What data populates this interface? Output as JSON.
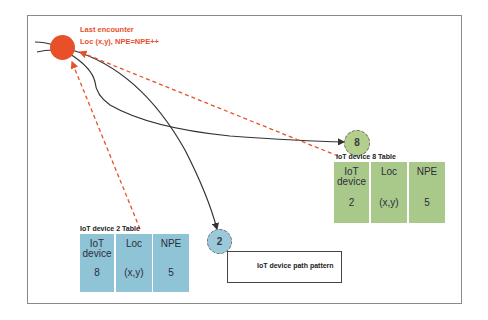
{
  "annotation": {
    "line1": "Last encounter",
    "line2": "Loc (x,y), NPE=NPE++",
    "color": "#e8502a"
  },
  "nodes": [
    {
      "id": "last-encounter",
      "label": "",
      "color": "#e8502a"
    },
    {
      "id": "device-8",
      "label": "8",
      "color": "#b3cf8c"
    },
    {
      "id": "device-2",
      "label": "2",
      "color": "#9cc8dc"
    }
  ],
  "tables": {
    "device2": {
      "title": "IoT device 2 Table",
      "color": "#8fc3d6",
      "columns": [
        {
          "header": "IoT device",
          "value": "8"
        },
        {
          "header": "Loc",
          "value": "(x,y)"
        },
        {
          "header": "NPE",
          "value": "5"
        }
      ]
    },
    "device8": {
      "title": "IoT device 8 Table",
      "color": "#a9c98a",
      "columns": [
        {
          "header": "IoT device",
          "value": "2"
        },
        {
          "header": "Loc",
          "value": "(x,y)"
        },
        {
          "header": "NPE",
          "value": "5"
        }
      ]
    }
  },
  "legend": {
    "label": "IoT device path pattern"
  }
}
